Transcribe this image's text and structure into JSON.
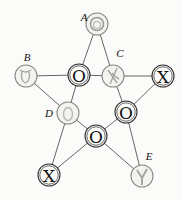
{
  "diagram": {
    "title": "",
    "labels": {
      "A": "A",
      "B": "B",
      "C": "C",
      "D": "D",
      "E": "E"
    },
    "nodes": [
      {
        "id": "A",
        "x": 97,
        "y": 24,
        "mark": "O",
        "state": "faint-erased"
      },
      {
        "id": "B",
        "x": 26,
        "y": 76,
        "mark": "O",
        "state": "faint-erased"
      },
      {
        "id": "N1",
        "x": 79,
        "y": 75,
        "mark": "O",
        "state": "placed"
      },
      {
        "id": "C",
        "x": 113,
        "y": 76,
        "mark": "X",
        "state": "faint-erased"
      },
      {
        "id": "N2",
        "x": 163,
        "y": 76,
        "mark": "X",
        "state": "placed"
      },
      {
        "id": "D",
        "x": 68,
        "y": 113,
        "mark": "O",
        "state": "faint-erased"
      },
      {
        "id": "N3",
        "x": 126,
        "y": 112,
        "mark": "O",
        "state": "placed"
      },
      {
        "id": "N4",
        "x": 96,
        "y": 136,
        "mark": "O",
        "state": "placed"
      },
      {
        "id": "N5",
        "x": 49,
        "y": 175,
        "mark": "X",
        "state": "placed"
      },
      {
        "id": "E",
        "x": 142,
        "y": 176,
        "mark": "X",
        "state": "faint-erased"
      }
    ],
    "marks": {
      "A": "O",
      "B": "O",
      "N1": "O",
      "C": "X",
      "N2": "X",
      "D": "O",
      "N3": "O",
      "N4": "O",
      "N5": "X",
      "E": "X"
    },
    "colors": {
      "background": "#fbfbf9",
      "stroke": "#333333",
      "faint_mark": "#a9a9a9"
    }
  }
}
